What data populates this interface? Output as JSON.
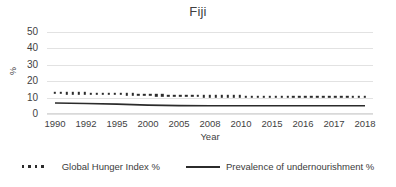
{
  "chart_data": {
    "type": "line",
    "title": "Fiji",
    "xlabel": "Year",
    "ylabel": "%",
    "grid": true,
    "legend_position": "bottom",
    "ylim": [
      0,
      50
    ],
    "yticks": [
      0,
      10,
      20,
      30,
      40,
      50
    ],
    "categories": [
      "1990",
      "1992",
      "1995",
      "2000",
      "2005",
      "2008",
      "2010",
      "2015",
      "2016",
      "2017",
      "2018"
    ],
    "series": [
      {
        "name": "Global Hunger Index %",
        "style": "dotted",
        "color": "#2b2b2b",
        "x": [
          "1990",
          "1992",
          "1995",
          "2000",
          "2005",
          "2008",
          "2010",
          "2015",
          "2016",
          "2017",
          "2018"
        ],
        "values": [
          12.8,
          12.5,
          12.2,
          11.6,
          11.1,
          10.8,
          10.7,
          10.5,
          10.5,
          10.4,
          10.4
        ]
      },
      {
        "name": "Prevalence of undernourishment %",
        "style": "solid",
        "color": "#2b2b2b",
        "x": [
          "1990",
          "1992",
          "1995",
          "2000",
          "2005",
          "2008",
          "2010",
          "2015",
          "2016",
          "2017",
          "2018"
        ],
        "values": [
          6.7,
          6.4,
          6.0,
          5.4,
          5.1,
          5.0,
          5.0,
          5.0,
          5.0,
          5.0,
          5.0
        ]
      }
    ]
  },
  "legend": {
    "items": [
      {
        "label": "Global Hunger Index %",
        "marker": "dotted-line-marker"
      },
      {
        "label": "Prevalence of undernourishment %",
        "marker": "solid-line-marker"
      }
    ]
  }
}
